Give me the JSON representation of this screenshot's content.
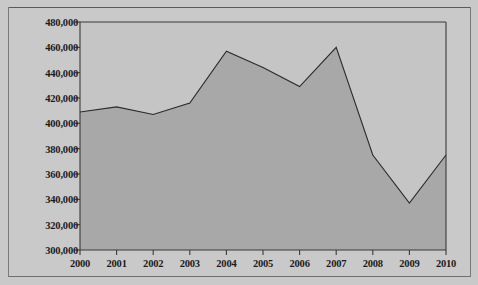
{
  "chart_data": {
    "type": "area",
    "title": "",
    "subtitle": "",
    "xlabel": "",
    "ylabel": "",
    "categories": [
      "2000",
      "2001",
      "2002",
      "2003",
      "2004",
      "2005",
      "2006",
      "2007",
      "2008",
      "2009",
      "2010"
    ],
    "values": [
      409000,
      413000,
      407000,
      416000,
      457000,
      444000,
      429000,
      460000,
      375000,
      337000,
      375000
    ],
    "series": [
      {
        "name": "",
        "values": [
          409000,
          413000,
          407000,
          416000,
          457000,
          444000,
          429000,
          460000,
          375000,
          337000,
          375000
        ]
      }
    ],
    "ylim": [
      300000,
      480000
    ],
    "ytick_step": 20000,
    "ytick_labels": [
      "300,000",
      "320,000",
      "340,000",
      "360,000",
      "380,000",
      "400,000",
      "420,000",
      "440,000",
      "460,000",
      "480,000"
    ],
    "ytick_values": [
      300000,
      320000,
      340000,
      360000,
      380000,
      400000,
      420000,
      440000,
      460000,
      480000
    ],
    "xtick_labels": [
      "2000",
      "2001",
      "2002",
      "2003",
      "2004",
      "2005",
      "2006",
      "2007",
      "2008",
      "2009",
      "2010"
    ],
    "grid": false,
    "legend": null,
    "legend_position": "none",
    "colors": {
      "page_background": "#c9c9c9",
      "plot_background": "#c5c5c5",
      "area_fill": "#a8a8a8",
      "line": "#2b2b2b",
      "axis": "#3a3a3a",
      "text": "#1c1c1c"
    }
  }
}
